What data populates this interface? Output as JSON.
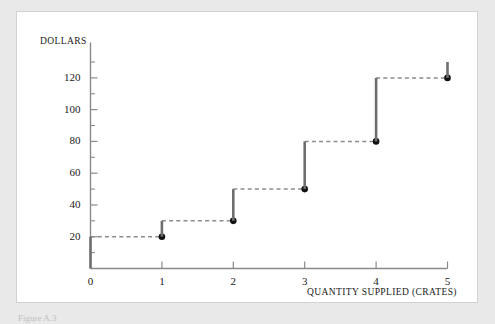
{
  "figure": {
    "caption": "Figure A.3",
    "panel_bg": "#ffffff",
    "outer_bg": "#e9e9e9",
    "border_color": "#d2d2d2"
  },
  "chart_data": {
    "type": "line",
    "subtype": "step",
    "title": "",
    "xlabel": "Quantity Supplied (Crates)",
    "ylabel": "Dollars",
    "xlim": [
      0,
      5
    ],
    "ylim": [
      0,
      130
    ],
    "grid": false,
    "legend": null,
    "x_ticks": [
      "0",
      "1",
      "2",
      "3",
      "4",
      "5"
    ],
    "x_tick_values": [
      0,
      1,
      2,
      3,
      4,
      5
    ],
    "y_ticks": [
      "20",
      "40",
      "60",
      "80",
      "100",
      "120"
    ],
    "y_tick_values": [
      20,
      40,
      60,
      80,
      100,
      120
    ],
    "y_minor_tick_values": [
      10,
      30,
      50,
      70,
      90,
      110,
      130
    ],
    "series": [
      {
        "name": "Supply",
        "style": "step",
        "riser_color": "#6e6e6e",
        "tread_color": "#8c8c8c",
        "tread_dashed": true,
        "point_color": "#111111",
        "x": [
          1,
          2,
          3,
          4,
          5
        ],
        "values": [
          20,
          30,
          50,
          80,
          120
        ],
        "steps": [
          {
            "x": 1,
            "y": 20,
            "riser_from": 0,
            "riser_at_x": 0,
            "tread_from_x": 0,
            "tread_to_x": 1
          },
          {
            "x": 2,
            "y": 30,
            "riser_from": 20,
            "riser_at_x": 1,
            "tread_from_x": 1,
            "tread_to_x": 2
          },
          {
            "x": 3,
            "y": 50,
            "riser_from": 30,
            "riser_at_x": 2,
            "tread_from_x": 2,
            "tread_to_x": 3
          },
          {
            "x": 4,
            "y": 80,
            "riser_from": 50,
            "riser_at_x": 3,
            "tread_from_x": 3,
            "tread_to_x": 4
          },
          {
            "x": 5,
            "y": 120,
            "riser_from": 80,
            "riser_at_x": 4,
            "tread_from_x": 4,
            "tread_to_x": 5
          },
          {
            "x": 5,
            "y": 130,
            "riser_from": 120,
            "riser_at_x": 5,
            "tread_from_x": null,
            "tread_to_x": null
          }
        ]
      }
    ],
    "axis_color": "#8a8a8a"
  }
}
